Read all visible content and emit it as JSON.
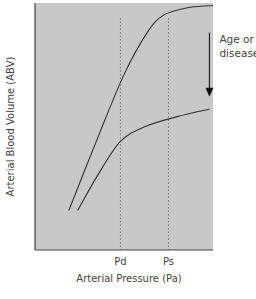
{
  "chart_data": {
    "type": "line",
    "title": "",
    "xlabel": "Arterial Pressure (Pa)",
    "ylabel": "Arterial Blood Volume (ABV)",
    "x_ticks": [
      {
        "label": "Pd",
        "x": 0.48
      },
      {
        "label": "Ps",
        "x": 0.75
      }
    ],
    "xlim": [
      0,
      1
    ],
    "ylim": [
      0,
      1
    ],
    "grid": false,
    "background": "#c8c8c8",
    "series": [
      {
        "name": "normal",
        "points": [
          [
            0.19,
            0.16
          ],
          [
            0.35,
            0.45
          ],
          [
            0.5,
            0.71
          ],
          [
            0.63,
            0.88
          ],
          [
            0.72,
            0.95
          ],
          [
            0.85,
            0.98
          ],
          [
            1.0,
            0.99
          ]
        ]
      },
      {
        "name": "aged-or-diseased",
        "points": [
          [
            0.24,
            0.16
          ],
          [
            0.35,
            0.3
          ],
          [
            0.48,
            0.44
          ],
          [
            0.62,
            0.5
          ],
          [
            0.8,
            0.54
          ],
          [
            0.98,
            0.57
          ]
        ]
      }
    ],
    "annotations": [
      {
        "type": "arrow",
        "direction": "down",
        "x": 0.98,
        "y_from": 0.88,
        "y_to": 0.62,
        "label": "Age or disease"
      },
      {
        "type": "vline",
        "style": "dotted",
        "x": 0.48,
        "label": "Pd"
      },
      {
        "type": "vline",
        "style": "dotted",
        "x": 0.75,
        "label": "Ps"
      }
    ],
    "colors": {
      "line": "#333333",
      "plot_bg": "#c8c8c8",
      "axis": "#444444"
    }
  },
  "labels": {
    "annotation_line1": "Age or",
    "annotation_line2": "disease"
  }
}
